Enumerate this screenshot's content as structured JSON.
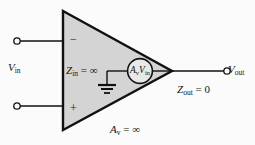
{
  "figure": {
    "kind": "op-amp-ideal-model-diagram",
    "width": 255,
    "height": 145,
    "background_color": "#fbfbfb",
    "amplifier_fill_color": "#d4d4d4",
    "line_color": "#111111"
  },
  "labels": {
    "v_in": {
      "symbol": "V",
      "subscript": "in",
      "text": "V_in"
    },
    "v_out": {
      "symbol": "V",
      "subscript": "out",
      "text": "V_out"
    },
    "z_in": {
      "symbol": "Z",
      "subscript": "in",
      "relation": "=",
      "value": "∞",
      "text": "Z_in = ∞"
    },
    "z_out": {
      "symbol": "Z",
      "subscript": "out",
      "relation": "=",
      "value": "0",
      "text": "Z_out = 0"
    },
    "a_v": {
      "symbol": "A",
      "subscript": "v",
      "relation": "=",
      "value": "∞",
      "text": "A_v = ∞"
    },
    "dependent_source": {
      "gain": "A",
      "gain_subscript": "v",
      "signal": "V",
      "signal_subscript": "in",
      "text": "A_v V_in"
    },
    "inverting_input": "−",
    "noninverting_input": "+"
  },
  "terminals": [
    {
      "name": "inverting-input-terminal",
      "label": "−"
    },
    {
      "name": "noninverting-input-terminal",
      "label": "+"
    },
    {
      "name": "output-terminal",
      "label": "V_out"
    }
  ],
  "components": [
    {
      "name": "amplifier-triangle",
      "type": "triangle"
    },
    {
      "name": "dependent-voltage-source",
      "type": "circle"
    },
    {
      "name": "ground-symbol",
      "type": "ground"
    }
  ]
}
